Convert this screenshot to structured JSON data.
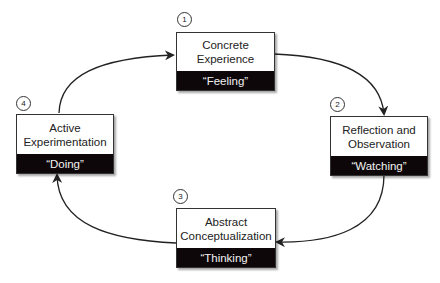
{
  "diagram": {
    "type": "cycle",
    "stages": [
      {
        "number": "1",
        "title": "Concrete\nExperience",
        "subtitle": "“Feeling”"
      },
      {
        "number": "2",
        "title": "Reflection and\nObservation",
        "subtitle": "“Watching”"
      },
      {
        "number": "3",
        "title": "Abstract\nConceptualization",
        "subtitle": "“Thinking”"
      },
      {
        "number": "4",
        "title": "Active\nExperimentation",
        "subtitle": "“Doing”"
      }
    ],
    "flow": [
      "1 -> 2",
      "2 -> 3",
      "3 -> 4",
      "4 -> 1"
    ],
    "colors": {
      "box_border": "#333333",
      "label_band": "#0e0709",
      "label_text": "#f2f2f2",
      "arrow": "#222222"
    }
  }
}
